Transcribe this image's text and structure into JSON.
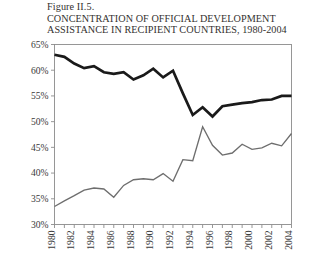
{
  "figure": {
    "number": "Figure II.5.",
    "title_line1": "CONCENTRATION OF OFFICIAL DEVELOPMENT",
    "title_line2": "ASSISTANCE IN RECIPIENT COUNTRIES, 1980-2004"
  },
  "colors": {
    "series_primary": "#1a1a1a",
    "series_secondary": "#6e6e6e",
    "axis": "#8c8c8c",
    "tick": "#8c8c8c",
    "text": "#33312f",
    "background": "#ffffff"
  },
  "chart_data": {
    "type": "line",
    "title": "CONCENTRATION OF OFFICIAL DEVELOPMENT ASSISTANCE IN RECIPIENT COUNTRIES, 1980-2004",
    "xlabel": "",
    "ylabel": "",
    "grid": false,
    "legend": "none",
    "xlim": [
      1980,
      2004
    ],
    "ylim": [
      30,
      65
    ],
    "ytick_labels": [
      "65%",
      "60%",
      "55%",
      "50%",
      "45%",
      "40%",
      "35%",
      "30%"
    ],
    "ytick_values": [
      65,
      60,
      55,
      50,
      45,
      40,
      35,
      30
    ],
    "x": [
      1980,
      1981,
      1982,
      1983,
      1984,
      1985,
      1986,
      1987,
      1988,
      1989,
      1990,
      1991,
      1992,
      1993,
      1994,
      1995,
      1996,
      1997,
      1998,
      1999,
      2000,
      2001,
      2002,
      2003,
      2004
    ],
    "xtick_labels": [
      "1980",
      "1982",
      "1984",
      "1986",
      "1988",
      "1990",
      "1992",
      "1994",
      "1996",
      "1998",
      "2000",
      "2002",
      "2004"
    ],
    "xtick_values": [
      1980,
      1982,
      1984,
      1986,
      1988,
      1990,
      1992,
      1994,
      1996,
      1998,
      2000,
      2002,
      2004
    ],
    "series": [
      {
        "name": "series-thick-black",
        "color": "#1a1a1a",
        "values": [
          63.0,
          62.6,
          61.3,
          60.4,
          60.8,
          59.6,
          59.3,
          59.6,
          58.2,
          59.0,
          60.3,
          58.6,
          59.9,
          55.5,
          51.3,
          52.8,
          51.0,
          53.0,
          53.3,
          53.6,
          53.8,
          54.2,
          54.3,
          55.0,
          55.0
        ]
      },
      {
        "name": "series-thin-gray",
        "color": "#6e6e6e",
        "values": [
          33.5,
          34.6,
          35.6,
          36.7,
          37.1,
          36.9,
          35.3,
          37.6,
          38.7,
          38.9,
          38.7,
          39.9,
          38.4,
          42.6,
          42.4,
          49.0,
          45.4,
          43.5,
          43.9,
          45.6,
          44.6,
          44.9,
          45.8,
          45.3,
          47.7
        ]
      }
    ]
  }
}
